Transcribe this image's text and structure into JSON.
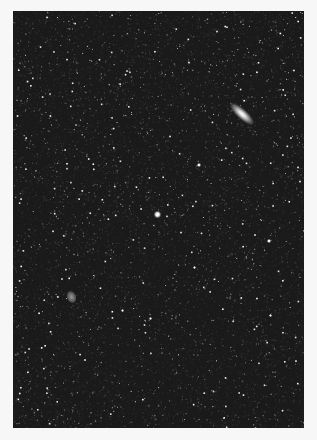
{
  "image": {
    "subject": "star field",
    "background_color": "#1a1a1a",
    "page_background": "#f7f7f7",
    "frame": {
      "left": 13,
      "top": 11,
      "width": 291,
      "height": 417
    }
  },
  "objects": [
    {
      "type": "galaxy",
      "name": "large-elongated-galaxy",
      "x": 241,
      "y": 115,
      "length": 30,
      "width": 10,
      "angle_deg": 42
    },
    {
      "type": "galaxy",
      "name": "small-faint-galaxy",
      "x": 71,
      "y": 296
    },
    {
      "type": "star",
      "name": "central-bright-star",
      "x": 157,
      "y": 214,
      "size": 7
    },
    {
      "type": "star",
      "name": "star",
      "x": 199,
      "y": 165,
      "size": 4
    },
    {
      "type": "star",
      "name": "star",
      "x": 269,
      "y": 241,
      "size": 4
    },
    {
      "type": "star",
      "name": "star",
      "x": 194,
      "y": 267,
      "size": 3
    },
    {
      "type": "star",
      "name": "star",
      "x": 270,
      "y": 315,
      "size": 3
    },
    {
      "type": "star",
      "name": "star",
      "x": 150,
      "y": 318,
      "size": 3
    },
    {
      "type": "star",
      "name": "star",
      "x": 122,
      "y": 310,
      "size": 3
    }
  ],
  "starfield": {
    "count": 2600,
    "seed": 7
  }
}
